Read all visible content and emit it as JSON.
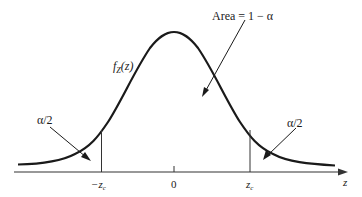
{
  "diagram": {
    "title": "",
    "curve_label_main": "f",
    "curve_label_sub": "Z",
    "curve_label_arg": "(z)",
    "center_area_label": "Area = 1 − α",
    "left_tail_label": "α/2",
    "right_tail_label": "α/2",
    "axis_label": "z",
    "ticks": {
      "neg_zc_main": "−z",
      "neg_zc_sub": "c",
      "zero": "0",
      "pos_zc_main": "z",
      "pos_zc_sub": "c"
    },
    "colors": {
      "curve": "#1a1a1a",
      "axis": "#333333",
      "text": "#1a1a1a",
      "background": "#ffffff"
    }
  }
}
